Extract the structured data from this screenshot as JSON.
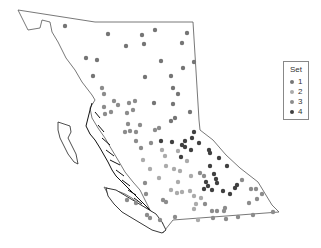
{
  "legend": {
    "title": "Set",
    "items": [
      {
        "label": "1",
        "color": "#757575"
      },
      {
        "label": "2",
        "color": "#ababab"
      },
      {
        "label": "3",
        "color": "#8c8c8c"
      },
      {
        "label": "4",
        "color": "#404040"
      }
    ]
  },
  "map": {
    "region": "British Columbia",
    "outline_color": "#555555",
    "points": [
      {
        "x": 65,
        "y": 26,
        "set": 1
      },
      {
        "x": 108,
        "y": 34,
        "set": 1
      },
      {
        "x": 142,
        "y": 35,
        "set": 1
      },
      {
        "x": 155,
        "y": 30,
        "set": 1
      },
      {
        "x": 187,
        "y": 33,
        "set": 1
      },
      {
        "x": 126,
        "y": 46,
        "set": 1
      },
      {
        "x": 144,
        "y": 44,
        "set": 1
      },
      {
        "x": 182,
        "y": 43,
        "set": 1
      },
      {
        "x": 86,
        "y": 58,
        "set": 1
      },
      {
        "x": 97,
        "y": 60,
        "set": 1
      },
      {
        "x": 161,
        "y": 61,
        "set": 1
      },
      {
        "x": 194,
        "y": 62,
        "set": 1
      },
      {
        "x": 93,
        "y": 76,
        "set": 1
      },
      {
        "x": 145,
        "y": 77,
        "set": 1
      },
      {
        "x": 171,
        "y": 76,
        "set": 1
      },
      {
        "x": 183,
        "y": 68,
        "set": 1
      },
      {
        "x": 102,
        "y": 88,
        "set": 3
      },
      {
        "x": 104,
        "y": 94,
        "set": 3
      },
      {
        "x": 173,
        "y": 88,
        "set": 1
      },
      {
        "x": 178,
        "y": 94,
        "set": 1
      },
      {
        "x": 114,
        "y": 101,
        "set": 3
      },
      {
        "x": 118,
        "y": 105,
        "set": 3
      },
      {
        "x": 129,
        "y": 103,
        "set": 3
      },
      {
        "x": 135,
        "y": 101,
        "set": 3
      },
      {
        "x": 154,
        "y": 103,
        "set": 1
      },
      {
        "x": 173,
        "y": 104,
        "set": 1
      },
      {
        "x": 104,
        "y": 107,
        "set": 3
      },
      {
        "x": 111,
        "y": 112,
        "set": 3
      },
      {
        "x": 105,
        "y": 114,
        "set": 3
      },
      {
        "x": 127,
        "y": 113,
        "set": 3
      },
      {
        "x": 133,
        "y": 110,
        "set": 3
      },
      {
        "x": 190,
        "y": 112,
        "set": 1
      },
      {
        "x": 128,
        "y": 124,
        "set": 3
      },
      {
        "x": 140,
        "y": 125,
        "set": 3
      },
      {
        "x": 171,
        "y": 121,
        "set": 1
      },
      {
        "x": 175,
        "y": 118,
        "set": 1
      },
      {
        "x": 125,
        "y": 132,
        "set": 3
      },
      {
        "x": 130,
        "y": 131,
        "set": 3
      },
      {
        "x": 136,
        "y": 132,
        "set": 3
      },
      {
        "x": 155,
        "y": 130,
        "set": 3
      },
      {
        "x": 159,
        "y": 128,
        "set": 3
      },
      {
        "x": 136,
        "y": 141,
        "set": 3
      },
      {
        "x": 151,
        "y": 143,
        "set": 3
      },
      {
        "x": 161,
        "y": 141,
        "set": 4
      },
      {
        "x": 172,
        "y": 142,
        "set": 4
      },
      {
        "x": 182,
        "y": 145,
        "set": 4
      },
      {
        "x": 185,
        "y": 141,
        "set": 4
      },
      {
        "x": 192,
        "y": 138,
        "set": 4
      },
      {
        "x": 194,
        "y": 132,
        "set": 4
      },
      {
        "x": 199,
        "y": 143,
        "set": 4
      },
      {
        "x": 141,
        "y": 148,
        "set": 3
      },
      {
        "x": 162,
        "y": 150,
        "set": 2
      },
      {
        "x": 178,
        "y": 151,
        "set": 2
      },
      {
        "x": 185,
        "y": 147,
        "set": 4
      },
      {
        "x": 191,
        "y": 150,
        "set": 4
      },
      {
        "x": 209,
        "y": 150,
        "set": 4
      },
      {
        "x": 210,
        "y": 153,
        "set": 4
      },
      {
        "x": 143,
        "y": 160,
        "set": 2
      },
      {
        "x": 165,
        "y": 156,
        "set": 2
      },
      {
        "x": 181,
        "y": 157,
        "set": 4
      },
      {
        "x": 187,
        "y": 161,
        "set": 2
      },
      {
        "x": 219,
        "y": 158,
        "set": 4
      },
      {
        "x": 150,
        "y": 169,
        "set": 2
      },
      {
        "x": 166,
        "y": 166,
        "set": 2
      },
      {
        "x": 174,
        "y": 169,
        "set": 2
      },
      {
        "x": 180,
        "y": 171,
        "set": 2
      },
      {
        "x": 191,
        "y": 176,
        "set": 2
      },
      {
        "x": 200,
        "y": 173,
        "set": 3
      },
      {
        "x": 204,
        "y": 176,
        "set": 3
      },
      {
        "x": 210,
        "y": 166,
        "set": 4
      },
      {
        "x": 214,
        "y": 174,
        "set": 4
      },
      {
        "x": 216,
        "y": 179,
        "set": 4
      },
      {
        "x": 227,
        "y": 166,
        "set": 4
      },
      {
        "x": 145,
        "y": 183,
        "set": 3
      },
      {
        "x": 159,
        "y": 178,
        "set": 2
      },
      {
        "x": 178,
        "y": 182,
        "set": 2
      },
      {
        "x": 206,
        "y": 182,
        "set": 4
      },
      {
        "x": 208,
        "y": 186,
        "set": 4
      },
      {
        "x": 217,
        "y": 183,
        "set": 4
      },
      {
        "x": 235,
        "y": 188,
        "set": 4
      },
      {
        "x": 237,
        "y": 185,
        "set": 4
      },
      {
        "x": 242,
        "y": 180,
        "set": 3
      },
      {
        "x": 171,
        "y": 190,
        "set": 2
      },
      {
        "x": 177,
        "y": 193,
        "set": 2
      },
      {
        "x": 182,
        "y": 192,
        "set": 2
      },
      {
        "x": 190,
        "y": 191,
        "set": 2
      },
      {
        "x": 204,
        "y": 189,
        "set": 4
      },
      {
        "x": 212,
        "y": 190,
        "set": 4
      },
      {
        "x": 223,
        "y": 191,
        "set": 4
      },
      {
        "x": 230,
        "y": 194,
        "set": 4
      },
      {
        "x": 251,
        "y": 189,
        "set": 3
      },
      {
        "x": 256,
        "y": 189,
        "set": 3
      },
      {
        "x": 146,
        "y": 194,
        "set": 3
      },
      {
        "x": 127,
        "y": 200,
        "set": 3
      },
      {
        "x": 136,
        "y": 203,
        "set": 3
      },
      {
        "x": 163,
        "y": 200,
        "set": 3
      },
      {
        "x": 166,
        "y": 202,
        "set": 3
      },
      {
        "x": 194,
        "y": 196,
        "set": 2
      },
      {
        "x": 201,
        "y": 198,
        "set": 2
      },
      {
        "x": 257,
        "y": 199,
        "set": 3
      },
      {
        "x": 262,
        "y": 194,
        "set": 3
      },
      {
        "x": 249,
        "y": 203,
        "set": 3
      },
      {
        "x": 196,
        "y": 204,
        "set": 2
      },
      {
        "x": 205,
        "y": 204,
        "set": 3
      },
      {
        "x": 194,
        "y": 209,
        "set": 2
      },
      {
        "x": 212,
        "y": 211,
        "set": 3
      },
      {
        "x": 217,
        "y": 211,
        "set": 3
      },
      {
        "x": 224,
        "y": 211,
        "set": 3
      },
      {
        "x": 225,
        "y": 208,
        "set": 3
      },
      {
        "x": 253,
        "y": 215,
        "set": 3
      },
      {
        "x": 273,
        "y": 212,
        "set": 3
      },
      {
        "x": 147,
        "y": 215,
        "set": 3
      },
      {
        "x": 150,
        "y": 218,
        "set": 3
      },
      {
        "x": 160,
        "y": 220,
        "set": 3
      },
      {
        "x": 175,
        "y": 217,
        "set": 3
      },
      {
        "x": 198,
        "y": 220,
        "set": 2
      },
      {
        "x": 213,
        "y": 218,
        "set": 3
      },
      {
        "x": 226,
        "y": 219,
        "set": 3
      },
      {
        "x": 238,
        "y": 217,
        "set": 3
      }
    ]
  }
}
